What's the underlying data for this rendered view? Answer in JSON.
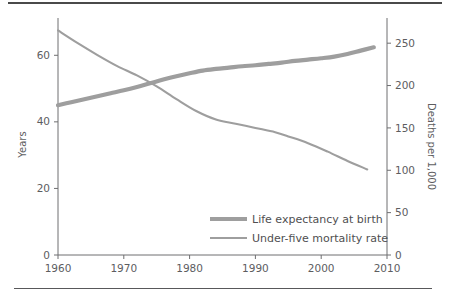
{
  "chart_data": {
    "type": "line",
    "title": "",
    "subtitle": "",
    "xlabel": "",
    "ylabel": "Years",
    "ylabel_right": "Deaths per 1,000",
    "xlim": [
      1960,
      2010
    ],
    "ylim": [
      0,
      70
    ],
    "ylim_right": [
      0,
      275
    ],
    "x_ticks": [
      "1960",
      "1970",
      "1980",
      "1990",
      "2000",
      "2010"
    ],
    "x_tick_values": [
      1960,
      1970,
      1980,
      1990,
      2000,
      2010
    ],
    "y_ticks_left": [
      "0",
      "20",
      "40",
      "60"
    ],
    "y_tick_values_left": [
      0,
      20,
      40,
      60
    ],
    "y_ticks_right": [
      "0",
      "50",
      "100",
      "150",
      "200",
      "250"
    ],
    "y_tick_values_right": [
      0,
      50,
      100,
      150,
      200,
      250
    ],
    "grid": false,
    "legend_position": "bottom-right",
    "series": [
      {
        "name": "Life expectancy at birth",
        "axis": "left",
        "color": "#9e9e9e",
        "stroke_width": 4.2,
        "x": [
          1960,
          1962,
          1964,
          1966,
          1968,
          1970,
          1972,
          1974,
          1976,
          1978,
          1980,
          1982,
          1984,
          1986,
          1988,
          1990,
          1992,
          1994,
          1996,
          1998,
          2000,
          2002,
          2004,
          2006,
          2008
        ],
        "values": [
          45.0,
          45.9,
          46.8,
          47.7,
          48.6,
          49.5,
          50.5,
          51.6,
          52.7,
          53.7,
          54.6,
          55.4,
          55.9,
          56.3,
          56.7,
          57.0,
          57.4,
          57.8,
          58.3,
          58.7,
          59.1,
          59.6,
          60.4,
          61.4,
          62.4
        ]
      },
      {
        "name": "Under-five mortality rate",
        "axis": "right",
        "color": "#9e9e9e",
        "stroke_width": 2.1,
        "x": [
          1960,
          1963,
          1966,
          1969,
          1972,
          1975,
          1978,
          1981,
          1984,
          1987,
          1990,
          1993,
          1995,
          1998,
          2001,
          2004,
          2007
        ],
        "values": [
          265,
          250,
          236,
          223,
          212,
          199,
          184,
          170,
          160,
          155,
          150,
          145,
          140,
          132,
          122,
          111,
          101
        ]
      }
    ],
    "legend_entries": [
      {
        "label": "Life expectancy at birth",
        "swatch": "thick",
        "color": "#9e9e9e"
      },
      {
        "label": "Under-five mortality rate",
        "swatch": "thin",
        "color": "#9e9e9e"
      }
    ]
  },
  "colors": {
    "series": "#9e9e9e",
    "axis": "#6e6e70",
    "text": "#5d5d5f",
    "rule": "#4a4a4a"
  }
}
